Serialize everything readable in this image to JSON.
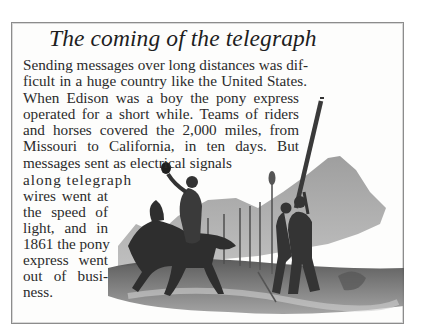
{
  "sidebar": {
    "title": "The coming of the telegraph",
    "lines": [
      "Sending messages over long distances was dif-",
      "ficult in a huge country like the United States.",
      "When Edison was a boy the pony express",
      "operated for a short while. Teams of riders",
      "and horses covered the 2,000 miles, from",
      "Missouri to California, in ten days. But",
      "messages sent as electrical signals",
      "along telegraph",
      "wires went at",
      "the speed of",
      "light, and in",
      "1861 the pony",
      "express went",
      "out of busi-",
      "ness."
    ],
    "illustration": {
      "subject": "pony-express rider on horseback waving hat while workers raise a telegraph pole, mountains behind",
      "style": "grayscale engraving"
    }
  },
  "colors": {
    "border": "#8c8c8c",
    "text": "#2b2b2b",
    "box_background": "#fdfdfc"
  }
}
